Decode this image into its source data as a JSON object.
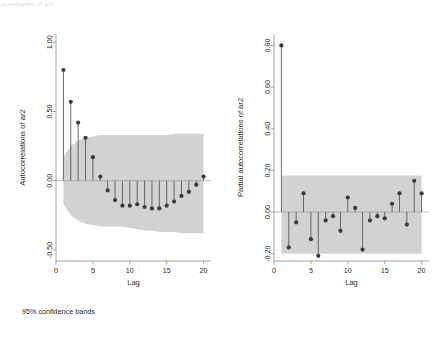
{
  "page": {
    "background": "#ffffff",
    "top_strip_text": "correlogram of ar2",
    "footnote": "95% confidence bands"
  },
  "style": {
    "band_color": "#d2d2d2",
    "marker_color": "#3a3a3a",
    "stem_color": "#595959",
    "axis_color": "#9a9a9a"
  },
  "chart_data": [
    {
      "id": "acf",
      "type": "bar",
      "title": "",
      "xlabel": "Lag",
      "ylabel": "Autocorrelations of ar2",
      "xlim": [
        0,
        21
      ],
      "ylim": [
        -0.58,
        1.06
      ],
      "xticks": [
        0,
        5,
        10,
        15,
        20
      ],
      "xtick_labels": [
        "0",
        "5",
        "10",
        "15",
        "20"
      ],
      "yticks": [
        1.0,
        0.5,
        0.0,
        -0.5
      ],
      "ytick_labels": [
        "1.00",
        "0.50",
        "0.00",
        "-0.50"
      ],
      "grid": false,
      "legend": "none",
      "x": [
        1,
        2,
        3,
        4,
        5,
        6,
        7,
        8,
        9,
        10,
        11,
        12,
        13,
        14,
        15,
        16,
        17,
        18,
        19,
        20
      ],
      "values": [
        0.8,
        0.57,
        0.42,
        0.31,
        0.17,
        0.03,
        -0.07,
        -0.14,
        -0.18,
        -0.18,
        -0.17,
        -0.19,
        -0.2,
        -0.2,
        -0.18,
        -0.15,
        -0.11,
        -0.08,
        -0.03,
        0.03
      ],
      "confidence_upper": [
        0.17,
        0.25,
        0.29,
        0.31,
        0.32,
        0.33,
        0.33,
        0.33,
        0.33,
        0.33,
        0.33,
        0.33,
        0.33,
        0.33,
        0.33,
        0.34,
        0.34,
        0.34,
        0.34,
        0.34
      ],
      "confidence_lower": [
        -0.17,
        -0.25,
        -0.29,
        -0.31,
        -0.32,
        -0.33,
        -0.33,
        -0.33,
        -0.33,
        -0.34,
        -0.35,
        -0.36,
        -0.36,
        -0.37,
        -0.37,
        -0.37,
        -0.38,
        -0.38,
        -0.38,
        -0.38
      ],
      "confidence_level": "95%"
    },
    {
      "id": "pacf",
      "type": "bar",
      "title": "",
      "xlabel": "Lag",
      "ylabel": "Partial autocorrelations of ar2",
      "xlim": [
        0,
        21
      ],
      "ylim": [
        -0.235,
        0.855
      ],
      "xticks": [
        0,
        5,
        10,
        15,
        20
      ],
      "xtick_labels": [
        "0",
        "5",
        "10",
        "15",
        "20"
      ],
      "yticks": [
        0.8,
        0.6,
        0.4,
        0.2,
        0.0,
        -0.2
      ],
      "ytick_labels": [
        "0.80",
        "0.60",
        "0.40",
        "0.20",
        "0.00",
        "-0.20"
      ],
      "grid": false,
      "legend": "none",
      "x": [
        1,
        2,
        3,
        4,
        5,
        6,
        7,
        8,
        9,
        10,
        11,
        12,
        13,
        14,
        15,
        16,
        17,
        18,
        19,
        20
      ],
      "values": [
        0.8,
        -0.17,
        -0.05,
        0.09,
        -0.13,
        -0.21,
        -0.04,
        -0.02,
        -0.09,
        0.07,
        0.02,
        -0.18,
        -0.04,
        -0.02,
        -0.03,
        0.04,
        0.09,
        -0.06,
        0.15,
        0.09
      ],
      "confidence_upper": [
        0.175,
        0.175,
        0.175,
        0.175,
        0.175,
        0.175,
        0.175,
        0.175,
        0.175,
        0.175,
        0.175,
        0.175,
        0.175,
        0.175,
        0.175,
        0.175,
        0.175,
        0.175,
        0.175,
        0.175
      ],
      "confidence_lower": [
        -0.2,
        -0.2,
        -0.2,
        -0.2,
        -0.2,
        -0.2,
        -0.2,
        -0.2,
        -0.2,
        -0.2,
        -0.2,
        -0.2,
        -0.2,
        -0.2,
        -0.2,
        -0.2,
        -0.2,
        -0.2,
        -0.2,
        -0.2
      ],
      "confidence_level": "95%"
    }
  ]
}
